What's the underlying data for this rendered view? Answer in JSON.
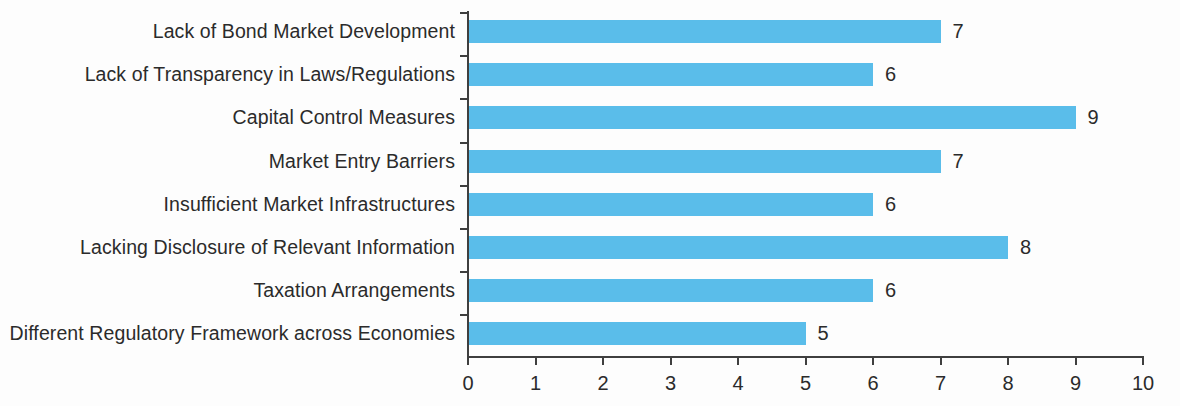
{
  "chart_data": {
    "type": "bar",
    "orientation": "horizontal",
    "title": "",
    "subtitle": "",
    "xlabel": "",
    "ylabel": "",
    "xlim": [
      0,
      10
    ],
    "xticks": [
      "0",
      "1",
      "2",
      "3",
      "4",
      "5",
      "6",
      "7",
      "8",
      "9",
      "10"
    ],
    "grid": false,
    "legend": null,
    "bar_color": "#5abdea",
    "text_color": "#2b2b2b",
    "axis_color": "#3f3f3f",
    "background_color": "#fdfdfd",
    "categories": [
      "Lack of Bond Market Development",
      "Lack of Transparency in Laws/Regulations",
      "Capital Control Measures",
      "Market Entry Barriers",
      "Insufficient Market Infrastructures",
      "Lacking Disclosure of Relevant Information",
      "Taxation Arrangements",
      "Different Regulatory Framework across Economies"
    ],
    "values": [
      7,
      6,
      9,
      7,
      6,
      8,
      6,
      5
    ],
    "data_labels": [
      "7",
      "6",
      "9",
      "7",
      "6",
      "8",
      "6",
      "5"
    ]
  }
}
